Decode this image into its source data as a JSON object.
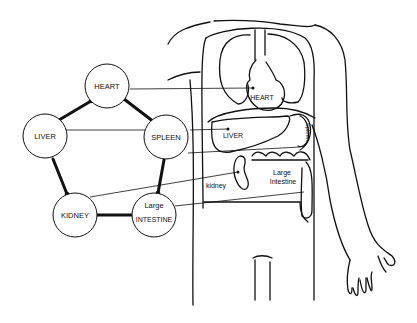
{
  "diagram": {
    "type": "five-element cycle mapped to body organs",
    "cycle_nodes": [
      {
        "id": "heart",
        "label": "HEART"
      },
      {
        "id": "spleen",
        "label": "SPLEEN"
      },
      {
        "id": "liver",
        "label": "LIVER"
      },
      {
        "id": "kidney",
        "label": "KIDNEY"
      },
      {
        "id": "large_intestine",
        "label_line1": "Large",
        "label_line2": "INTESTINE"
      }
    ],
    "cycle_edges": [
      {
        "from": "liver",
        "to": "heart"
      },
      {
        "from": "heart",
        "to": "spleen"
      },
      {
        "from": "spleen",
        "to": "large_intestine"
      },
      {
        "from": "large_intestine",
        "to": "kidney"
      },
      {
        "from": "kidney",
        "to": "liver"
      }
    ],
    "body_labels": {
      "heart": "HEART",
      "liver": "LIVER",
      "spleen": "Spleen",
      "kidney": "kidney",
      "large_intestine_line1": "Large",
      "large_intestine_line2": "Intestine"
    },
    "colors": {
      "ink": "#111111",
      "background": "#ffffff"
    }
  }
}
